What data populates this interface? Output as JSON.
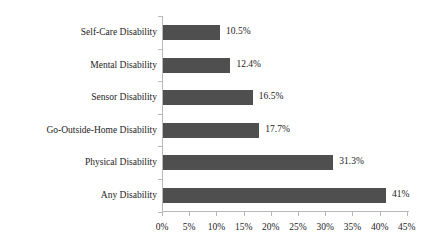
{
  "chart_data": {
    "type": "bar",
    "orientation": "horizontal",
    "title": "",
    "subtitle": "",
    "xlabel": "",
    "ylabel": "",
    "grid": false,
    "legend": null,
    "xlim": [
      0,
      45
    ],
    "xticks": [
      "0%",
      "5%",
      "10%",
      "15%",
      "20%",
      "25%",
      "30%",
      "35%",
      "40%",
      "45%"
    ],
    "xtick_values": [
      0,
      5,
      10,
      15,
      20,
      25,
      30,
      35,
      40,
      45
    ],
    "categories": [
      "Self-Care Disability",
      "Mental Disability",
      "Sensor Disability",
      "Go-Outside-Home Disability",
      "Physical Disability",
      "Any Disability"
    ],
    "values": [
      10.5,
      12.4,
      16.5,
      17.7,
      31.3,
      41
    ],
    "data_labels": [
      "10.5%",
      "12.4%",
      "16.5%",
      "17.7%",
      "31.3%",
      "41%"
    ],
    "series": [
      {
        "name": "Disability prevalence",
        "values": [
          10.5,
          12.4,
          16.5,
          17.7,
          31.3,
          41
        ],
        "color": "#4f4f4f"
      }
    ]
  },
  "colors": {
    "bar": "#4f4f4f",
    "axis": "#b8b8b8",
    "text": "#1c1c1c",
    "background": "#ffffff"
  },
  "bars": [
    {
      "label": "Self-Care Disability",
      "value_text": "10.5%",
      "value": 10.5
    },
    {
      "label": "Mental Disability",
      "value_text": "12.4%",
      "value": 12.4
    },
    {
      "label": "Sensor Disability",
      "value_text": "16.5%",
      "value": 16.5
    },
    {
      "label": "Go-Outside-Home Disability",
      "value_text": "17.7%",
      "value": 17.7
    },
    {
      "label": "Physical Disability",
      "value_text": "31.3%",
      "value": 31.3
    },
    {
      "label": "Any Disability",
      "value_text": "41%",
      "value": 41
    }
  ],
  "axis": {
    "ticks": [
      {
        "text": "0%",
        "value": 0
      },
      {
        "text": "5%",
        "value": 5
      },
      {
        "text": "10%",
        "value": 10
      },
      {
        "text": "15%",
        "value": 15
      },
      {
        "text": "20%",
        "value": 20
      },
      {
        "text": "25%",
        "value": 25
      },
      {
        "text": "30%",
        "value": 30
      },
      {
        "text": "35%",
        "value": 35
      },
      {
        "text": "40%",
        "value": 40
      },
      {
        "text": "45%",
        "value": 45
      }
    ]
  }
}
